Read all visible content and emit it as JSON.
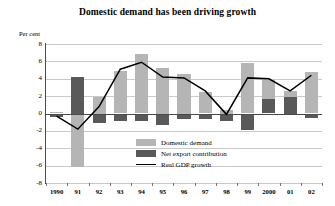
{
  "chart_data": {
    "type": "bar",
    "title": "Domestic demand has been driving growth",
    "subtitle": "",
    "xlabel": "",
    "ylabel": "Per cent",
    "unit_label": "Per cent",
    "ylim": [
      -8,
      8
    ],
    "ytick_step": 2,
    "yticks": [
      8,
      6,
      4,
      2,
      0,
      -2,
      -4,
      -6,
      -8
    ],
    "ytick_labels": [
      "8",
      "6",
      "4",
      "2",
      "0",
      "-2",
      "-4",
      "-6",
      "-8"
    ],
    "grid": true,
    "legend_position": "inside-center-bottom",
    "categories": [
      "1990",
      "91",
      "92",
      "93",
      "94",
      "95",
      "96",
      "97",
      "98",
      "99",
      "2000",
      "01",
      "02"
    ],
    "x_full_years": [
      1990,
      1991,
      1992,
      1993,
      1994,
      1995,
      1996,
      1997,
      1998,
      1999,
      2000,
      2001,
      2002
    ],
    "series": [
      {
        "name": "Domestic demand",
        "kind": "bar",
        "color": "#b5b5b5",
        "values": [
          0.2,
          -6.1,
          1.9,
          4.9,
          6.8,
          5.3,
          4.6,
          2.5,
          0.4,
          5.8,
          3.9,
          2.6,
          4.8
        ]
      },
      {
        "name": "Net export contribution",
        "kind": "bar",
        "color": "#595959",
        "values": [
          -0.4,
          4.2,
          -1.1,
          -0.9,
          -0.9,
          -1.3,
          -0.6,
          -0.6,
          -0.8,
          -1.9,
          1.7,
          1.9,
          -0.5
        ]
      },
      {
        "name": "Real GDP growth",
        "kind": "line",
        "color": "#000000",
        "values": [
          -0.3,
          -1.8,
          0.8,
          5.1,
          5.9,
          4.2,
          4.1,
          2.6,
          -0.1,
          4.1,
          4.0,
          2.6,
          4.4
        ]
      }
    ],
    "legend": [
      {
        "label": "Domestic demand",
        "swatch": "light-gray-box"
      },
      {
        "label": "Net export contribution",
        "swatch": "dark-gray-box"
      },
      {
        "label": "Real GDP growth",
        "swatch": "black-line"
      }
    ],
    "colors": {
      "domestic_demand": "#b5b5b5",
      "net_export_contribution": "#595959",
      "real_gdp_growth": "#000000",
      "gridline": "#c9c9c9",
      "axis": "#4a4a4a",
      "background": "#ffffff"
    }
  }
}
